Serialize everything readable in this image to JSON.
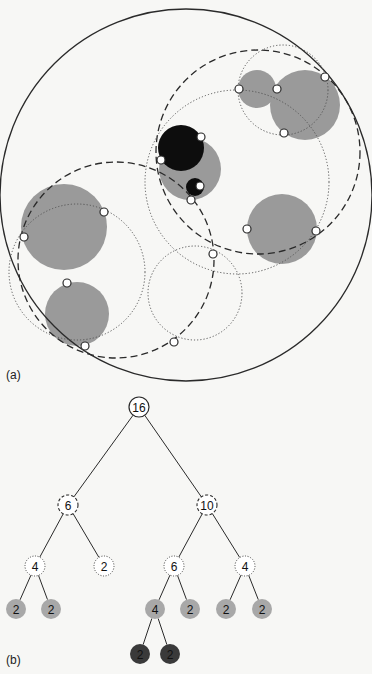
{
  "figure": {
    "panel_a_label": "(a)",
    "panel_b_label": "(b)",
    "colors": {
      "background": "#f7f7f5",
      "stroke": "#2a2a2a",
      "gray_fill": "#9a9a9a",
      "dark_gray_fill": "#8a8a8a",
      "black_fill": "#0d0d0d",
      "marker_fill": "#ffffff",
      "leaf_gray": "#a8a8a8",
      "leaf_dark": "#3a3a3a"
    }
  },
  "panel_a": {
    "outer_circle": {
      "cx": 186,
      "cy": 195,
      "r": 186
    },
    "filled_circles": [
      {
        "id": "top-right-small",
        "cx": 257,
        "cy": 89,
        "r": 19,
        "fill": "gray"
      },
      {
        "id": "top-right-large",
        "cx": 305,
        "cy": 105,
        "r": 35,
        "fill": "gray"
      },
      {
        "id": "center-gray",
        "cx": 190,
        "cy": 169,
        "r": 31,
        "fill": "gray"
      },
      {
        "id": "center-black-large",
        "cx": 181,
        "cy": 148,
        "r": 23,
        "fill": "black"
      },
      {
        "id": "center-black-small",
        "cx": 195,
        "cy": 187,
        "r": 9,
        "fill": "black"
      },
      {
        "id": "right-gray",
        "cx": 282,
        "cy": 229,
        "r": 35,
        "fill": "gray"
      },
      {
        "id": "left-upper-gray",
        "cx": 64,
        "cy": 227,
        "r": 43,
        "fill": "gray"
      },
      {
        "id": "left-lower-gray",
        "cx": 77,
        "cy": 314,
        "r": 32,
        "fill": "gray"
      }
    ],
    "dashed_circles": [
      {
        "cx": 258,
        "cy": 152,
        "r": 102
      },
      {
        "cx": 116,
        "cy": 260,
        "r": 98
      }
    ],
    "dotted_circles": [
      {
        "cx": 283,
        "cy": 90,
        "r": 45
      },
      {
        "cx": 237,
        "cy": 182,
        "r": 92
      },
      {
        "cx": 77,
        "cy": 272,
        "r": 68
      },
      {
        "cx": 195,
        "cy": 293,
        "r": 47
      }
    ],
    "markers": [
      {
        "x": 239,
        "y": 89
      },
      {
        "x": 277,
        "y": 89
      },
      {
        "x": 325,
        "y": 77
      },
      {
        "x": 284,
        "y": 133
      },
      {
        "x": 201,
        "y": 137
      },
      {
        "x": 161,
        "y": 160
      },
      {
        "x": 200,
        "y": 186
      },
      {
        "x": 191,
        "y": 200
      },
      {
        "x": 247,
        "y": 229
      },
      {
        "x": 316,
        "y": 231
      },
      {
        "x": 104,
        "y": 212
      },
      {
        "x": 24,
        "y": 237
      },
      {
        "x": 67,
        "y": 283
      },
      {
        "x": 85,
        "y": 346
      },
      {
        "x": 213,
        "y": 254
      },
      {
        "x": 174,
        "y": 342
      }
    ]
  },
  "panel_b": {
    "tree": {
      "nodes": [
        {
          "id": "n16",
          "label": "16",
          "x": 139,
          "y": 407,
          "style": "solid"
        },
        {
          "id": "n6a",
          "label": "6",
          "x": 68,
          "y": 505,
          "style": "dashed"
        },
        {
          "id": "n10",
          "label": "10",
          "x": 207,
          "y": 505,
          "style": "dashed"
        },
        {
          "id": "n4a",
          "label": "4",
          "x": 35,
          "y": 566,
          "style": "dotted"
        },
        {
          "id": "n2a",
          "label": "2",
          "x": 104,
          "y": 566,
          "style": "dotted"
        },
        {
          "id": "n6b",
          "label": "6",
          "x": 174,
          "y": 566,
          "style": "dotted"
        },
        {
          "id": "n4b",
          "label": "4",
          "x": 245,
          "y": 566,
          "style": "dotted"
        },
        {
          "id": "l1",
          "label": "2",
          "x": 16,
          "y": 609,
          "style": "gray"
        },
        {
          "id": "l2",
          "label": "2",
          "x": 51,
          "y": 609,
          "style": "gray"
        },
        {
          "id": "l3",
          "label": "4",
          "x": 155,
          "y": 609,
          "style": "gray"
        },
        {
          "id": "l4",
          "label": "2",
          "x": 190,
          "y": 609,
          "style": "gray"
        },
        {
          "id": "l5",
          "label": "2",
          "x": 226,
          "y": 609,
          "style": "gray"
        },
        {
          "id": "l6",
          "label": "2",
          "x": 262,
          "y": 609,
          "style": "gray"
        },
        {
          "id": "l7",
          "label": "2",
          "x": 140,
          "y": 654,
          "style": "dark"
        },
        {
          "id": "l8",
          "label": "2",
          "x": 170,
          "y": 654,
          "style": "dark"
        }
      ],
      "edges": [
        [
          "n16",
          "n6a"
        ],
        [
          "n16",
          "n10"
        ],
        [
          "n6a",
          "n4a"
        ],
        [
          "n6a",
          "n2a"
        ],
        [
          "n10",
          "n6b"
        ],
        [
          "n10",
          "n4b"
        ],
        [
          "n4a",
          "l1"
        ],
        [
          "n4a",
          "l2"
        ],
        [
          "n6b",
          "l3"
        ],
        [
          "n6b",
          "l4"
        ],
        [
          "n4b",
          "l5"
        ],
        [
          "n4b",
          "l6"
        ],
        [
          "l3",
          "l7"
        ],
        [
          "l3",
          "l8"
        ]
      ]
    }
  }
}
